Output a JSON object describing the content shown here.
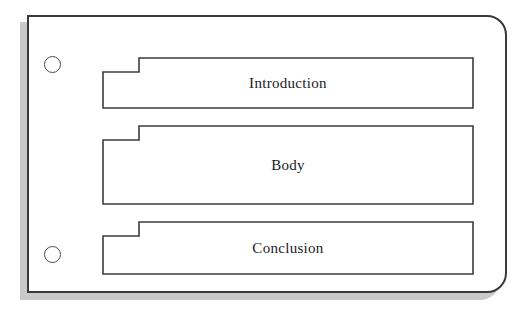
{
  "document": {
    "title": "Essay Structure Tabbed Page",
    "page_shape": "rounded-right-corners-card",
    "background_color": "#ffffff",
    "card_color": "#ffffff",
    "border_color": "#39393b",
    "shadow_color": "#c9c9c9"
  },
  "binder_holes": [
    {
      "name": "top-hole",
      "label": ""
    },
    {
      "name": "bottom-hole",
      "label": ""
    }
  ],
  "tabs": [
    {
      "id": "introduction",
      "label": "Introduction",
      "order": 1
    },
    {
      "id": "body",
      "label": "Body",
      "order": 2
    },
    {
      "id": "conclusion",
      "label": "Conclusion",
      "order": 3
    }
  ]
}
